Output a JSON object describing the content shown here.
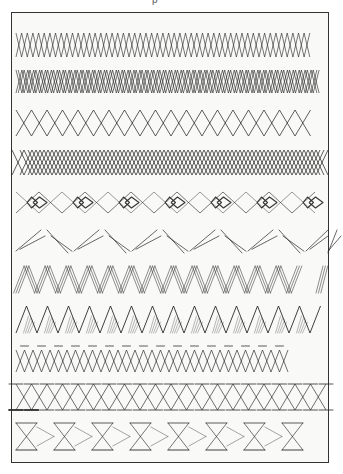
{
  "page": {
    "title_fragment": "p",
    "stroke_color": "#2b2b2b",
    "frame_color": "#333333",
    "paper_color": "#f9f9f8"
  },
  "rows": [
    {
      "id": 1,
      "name": "simple-x-lattice",
      "type": "xlattice",
      "y": 33,
      "h": 24,
      "x0": 16,
      "x1": 310,
      "period": 11.3,
      "lines": 1
    },
    {
      "id": 2,
      "name": "double-x-lattice",
      "type": "xlattice",
      "y": 70,
      "h": 23,
      "x0": 16,
      "x1": 322,
      "period": 11.8,
      "lines": 2
    },
    {
      "id": 3,
      "name": "wide-diamond-chain",
      "type": "diamonds",
      "y": 110,
      "h": 26,
      "x0": 16,
      "x1": 322,
      "period": 31,
      "lines": 1
    },
    {
      "id": 4,
      "name": "triple-offset-diamond-lattice",
      "type": "diamonds",
      "y": 150,
      "h": 25,
      "x0": 12,
      "x1": 330,
      "period": 24,
      "lines": 3
    },
    {
      "id": 5,
      "name": "diamond-chain-with-nested-clusters",
      "type": "clusters",
      "y": 190,
      "h": 25,
      "x0": 16,
      "x1": 328,
      "period": 46
    },
    {
      "id": 6,
      "name": "double-chevron",
      "type": "chevron",
      "y": 230,
      "h": 23,
      "x0": 16,
      "x1": 328,
      "period": 58,
      "lines": 2
    },
    {
      "id": 7,
      "name": "hatched-triple-zigzag",
      "type": "hatchzig",
      "y": 266,
      "h": 27,
      "x0": 16,
      "x1": 300,
      "period": 21,
      "fragment_x": 316
    },
    {
      "id": 8,
      "name": "zigzag-with-hatched-triangles",
      "type": "zighatch",
      "y": 306,
      "h": 27,
      "x0": 16,
      "x1": 322,
      "period": 21
    },
    {
      "id": 9,
      "name": "x-lattice-with-top-triangles",
      "type": "xtri",
      "y": 346,
      "h": 26,
      "x0": 16,
      "x1": 296,
      "period": 17
    },
    {
      "id": 10,
      "name": "bowtie-lattice-double-triangles",
      "type": "bowtie",
      "y": 384,
      "h": 26,
      "x0": 16,
      "x1": 330,
      "period": 31
    },
    {
      "id": 11,
      "name": "sparse-hourglass-band",
      "type": "hourglass",
      "y": 423,
      "h": 27,
      "x0": 16,
      "x1": 296,
      "period": 38
    }
  ]
}
